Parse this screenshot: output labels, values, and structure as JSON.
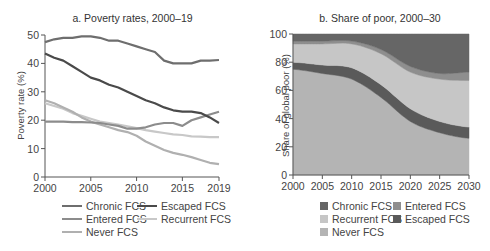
{
  "chart_data": [
    {
      "type": "line",
      "title": "a. Poverty rates, 2000–19",
      "xlabel": "",
      "ylabel": "Poverty rate (%)",
      "xlim": [
        2000,
        2019
      ],
      "ylim": [
        0,
        50
      ],
      "x_ticks": [
        "2000",
        "2005",
        "2010",
        "2015",
        "2019"
      ],
      "y_ticks": [
        "0",
        "10",
        "20",
        "30",
        "40",
        "50"
      ],
      "grid": false,
      "legend_position": "bottom",
      "x": [
        2000,
        2001,
        2002,
        2003,
        2004,
        2005,
        2006,
        2007,
        2008,
        2009,
        2010,
        2011,
        2012,
        2013,
        2014,
        2015,
        2016,
        2017,
        2018,
        2019
      ],
      "series": [
        {
          "name": "Chronic FCS",
          "color": "#6e6e6e",
          "values": [
            47.5,
            48.5,
            49,
            49,
            49.5,
            49.5,
            49,
            48,
            48,
            47,
            46,
            45,
            44,
            41,
            40,
            40,
            40,
            41,
            41,
            41.2
          ]
        },
        {
          "name": "Escaped FCS",
          "color": "#4a4a4a",
          "values": [
            43.5,
            42,
            41,
            39,
            37,
            35,
            34,
            32.5,
            31.5,
            30,
            28.5,
            27,
            26,
            24.5,
            23.5,
            23,
            23,
            22.5,
            21,
            19
          ]
        },
        {
          "name": "Entered FCS",
          "color": "#8c8c8c",
          "values": [
            19.5,
            19.5,
            19.5,
            19.3,
            19.3,
            19.2,
            19,
            18.5,
            18,
            17,
            17,
            17.5,
            18.5,
            19,
            19,
            18,
            20,
            21,
            22,
            23
          ]
        },
        {
          "name": "Recurrent FCS",
          "color": "#c8c8c8",
          "values": [
            26,
            25,
            24,
            22.5,
            21.5,
            20.5,
            19.5,
            19,
            18.5,
            17.8,
            17.2,
            16.5,
            16,
            15.5,
            15,
            14.8,
            14.3,
            14.2,
            14,
            14
          ]
        },
        {
          "name": "Never FCS",
          "color": "#b0b0b0",
          "values": [
            27,
            26,
            24.5,
            23,
            21,
            19.5,
            18.5,
            17.5,
            16.5,
            15.8,
            14.5,
            12.5,
            11,
            9.5,
            8.5,
            7.8,
            7,
            6,
            5,
            4.5
          ]
        }
      ]
    },
    {
      "type": "area",
      "stacked": true,
      "title": "b. Share of poor, 2000–30",
      "xlabel": "",
      "ylabel": "Share of global poor (%)",
      "xlim": [
        2000,
        2030
      ],
      "ylim": [
        0,
        100
      ],
      "x_ticks": [
        "2000",
        "2005",
        "2010",
        "2015",
        "2020",
        "2025",
        "2030"
      ],
      "y_ticks": [
        "0",
        "20",
        "40",
        "60",
        "80",
        "100"
      ],
      "grid": false,
      "legend_position": "bottom",
      "x": [
        2000,
        2005,
        2010,
        2015,
        2020,
        2025,
        2030
      ],
      "series": [
        {
          "name": "Never FCS",
          "color": "#b4b4b4",
          "values": [
            75,
            72,
            68,
            55,
            38,
            30,
            26
          ]
        },
        {
          "name": "Escaped FCS",
          "color": "#5a5a5a",
          "values": [
            5,
            6,
            8,
            9,
            9,
            8,
            8
          ]
        },
        {
          "name": "Recurrent FCS",
          "color": "#c6c6c6",
          "values": [
            13,
            15,
            17,
            22,
            26,
            30,
            33
          ]
        },
        {
          "name": "Entered FCS",
          "color": "#8e8e8e",
          "values": [
            2,
            2,
            2,
            3,
            4,
            4,
            6
          ]
        },
        {
          "name": "Chronic FCS",
          "color": "#666666",
          "values": [
            5,
            5,
            5,
            11,
            23,
            28,
            27
          ]
        }
      ]
    }
  ],
  "panel_a": {
    "title": "a. Poverty rates, 2000–19",
    "ylabel": "Poverty rate (%)",
    "legend": [
      "Chronic FCS",
      "Escaped FCS",
      "Entered FCS",
      "Recurrent FCS",
      "Never FCS"
    ]
  },
  "panel_b": {
    "title": "b. Share of poor, 2000–30",
    "ylabel": "Share of global poor (%)",
    "legend": [
      "Chronic FCS",
      "Entered FCS",
      "Recurrent FCS",
      "Escaped FCS",
      "Never FCS"
    ]
  }
}
